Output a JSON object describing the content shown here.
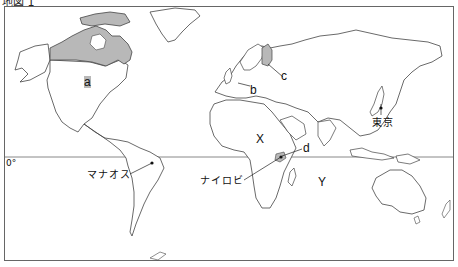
{
  "caption": "地図 1",
  "equator_label": "0°",
  "labels": {
    "a": "a",
    "b": "b",
    "c": "c",
    "d": "d",
    "x": "X",
    "y": "Y"
  },
  "cities": {
    "tokyo": "東京",
    "nairobi": "ナイロビ",
    "manaus": "マナオス"
  },
  "colors": {
    "highlight_fill": "#b8b8b8",
    "coast_line": "#444444",
    "frame": "#666666",
    "equator": "#888888"
  }
}
